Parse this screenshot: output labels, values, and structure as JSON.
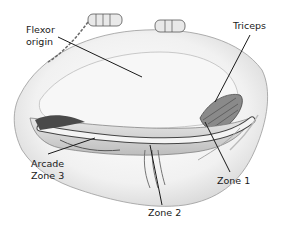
{
  "figure": {
    "type": "anatomical-illustration",
    "labels": {
      "flexor_origin_line1": "Flexor",
      "flexor_origin_line2": "origin",
      "triceps": "Triceps",
      "arcade_line1": "Arcade",
      "arcade_line2": "Zone 3",
      "zone1": "Zone 1",
      "zone2": "Zone 2"
    },
    "colors": {
      "line": "#1a1a1a",
      "tissue_shade": "#cfcfcf",
      "dark_detail": "#555555"
    }
  }
}
